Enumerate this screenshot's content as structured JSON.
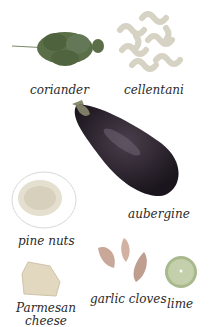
{
  "ingredients": [
    {
      "name": "coriander"
    },
    {
      "name": "cellentani"
    },
    {
      "name": "aubergine"
    },
    {
      "name": "pine nuts"
    },
    {
      "name": "Parmesan",
      "name2": "cheese"
    },
    {
      "name": "garlic cloves"
    },
    {
      "name": "lime"
    }
  ],
  "colors": {
    "coriander": "#5a6e48",
    "cellentani": "#d6d2c4",
    "aubergine": "#1d1620",
    "pine_nuts": "#e4dfcf",
    "parmesan": "#e2d7bf",
    "garlic": "#c9a89a",
    "lime": "#bcc9a3"
  }
}
